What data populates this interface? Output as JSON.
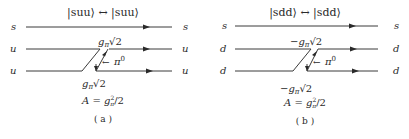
{
  "panels": [
    {
      "id": "a",
      "title": "|suu⟩ ↔ |suu⟩",
      "quark_lines": [
        {
          "left": "s",
          "right": "s"
        },
        {
          "left": "u",
          "right": "u"
        },
        {
          "left": "u",
          "right": "u"
        }
      ],
      "vertex_top": "gπ√2",
      "vertex_bottom": "gπ√2",
      "exchange_particle": "π⁰",
      "amplitude": "A = gπ²/2",
      "caption": "( a )"
    },
    {
      "id": "b",
      "title": "|sdd⟩ ↔ |sdd⟩",
      "quark_lines": [
        {
          "left": "s",
          "right": "s"
        },
        {
          "left": "d",
          "right": "d"
        },
        {
          "left": "d",
          "right": "d"
        }
      ],
      "vertex_top": "−gπ√2",
      "vertex_bottom": "−gπ√2",
      "exchange_particle": "π⁰",
      "amplitude": "A = gπ²/2",
      "caption": "( b )"
    }
  ],
  "labels": {
    "a_title": "|suu⟩ ↔ |suu⟩",
    "b_title": "|sdd⟩ ↔ |sdd⟩",
    "a_s_left": "s",
    "a_s_right": "s",
    "a_q1_left": "u",
    "a_q1_right": "u",
    "a_q2_left": "u",
    "a_q2_right": "u",
    "b_s_left": "s",
    "b_s_right": "s",
    "b_q1_left": "d",
    "b_q1_right": "d",
    "b_q2_left": "d",
    "b_q2_right": "d",
    "a_g": "g",
    "a_pi_sub": "π",
    "a_sqrt": "√2",
    "b_neg": "−",
    "b_g": "g",
    "b_pi_sub": "π",
    "b_sqrt": "√2",
    "pi": "π",
    "pi_sup": "0",
    "pi_arrow": "←",
    "amp_A": "A",
    "amp_eq": " = ",
    "amp_g": "g",
    "amp_sup": "2",
    "amp_sub": "π",
    "amp_div": "/2",
    "a_caption": "( a )",
    "b_caption": "( b )"
  }
}
